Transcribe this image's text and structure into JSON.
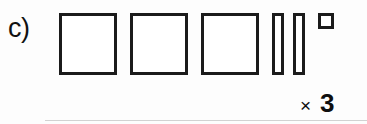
{
  "figure": {
    "label": "c)",
    "width": 367,
    "height": 124,
    "background_color": "#fdfdfd",
    "stroke_color": "#1b1b1b",
    "fill_color": "#ffffff",
    "rule_color": "#d2d2d2"
  },
  "multiplier": {
    "sign": "×",
    "count": "3"
  },
  "chart_data": {
    "type": "diagram",
    "title": "c)",
    "shapes": [
      {
        "name": "large-square-1",
        "kind": "square",
        "x": 59,
        "y": 13,
        "width": 58,
        "height": 62,
        "stroke": 3,
        "filled": false
      },
      {
        "name": "large-square-2",
        "kind": "square",
        "x": 130,
        "y": 13,
        "width": 58,
        "height": 62,
        "stroke": 3,
        "filled": false
      },
      {
        "name": "large-square-3",
        "kind": "square",
        "x": 201,
        "y": 13,
        "width": 58,
        "height": 62,
        "stroke": 3,
        "filled": false
      },
      {
        "name": "narrow-rod-1",
        "kind": "rod",
        "x": 272,
        "y": 13,
        "width": 12,
        "height": 62,
        "stroke": 3,
        "filled": false
      },
      {
        "name": "narrow-rod-2",
        "kind": "rod",
        "x": 293,
        "y": 13,
        "width": 12,
        "height": 62,
        "stroke": 3,
        "filled": false
      },
      {
        "name": "small-square",
        "kind": "square",
        "x": 318,
        "y": 13,
        "width": 16,
        "height": 16,
        "stroke": 3,
        "filled": false
      }
    ],
    "annotations": [
      {
        "name": "multiplier",
        "text": "× 3",
        "x": 300,
        "y": 90
      }
    ],
    "rules": [
      {
        "name": "baseline-rule",
        "x": 45,
        "y": 120,
        "width": 322,
        "height": 1
      }
    ],
    "counts": {
      "large_squares": 3,
      "narrow_rods": 2,
      "small_squares": 1,
      "multiplier": 3
    }
  }
}
